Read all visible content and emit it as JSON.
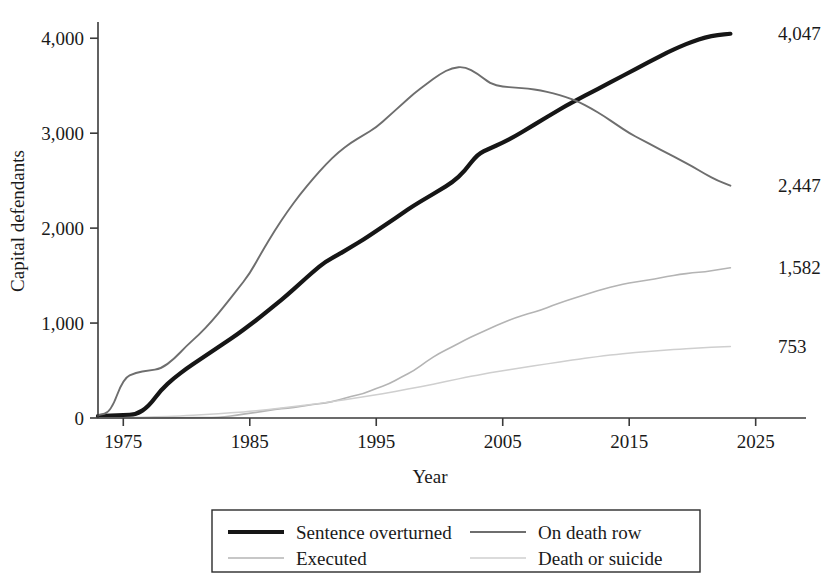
{
  "figure": {
    "width": 829,
    "height": 575,
    "background": "#ffffff"
  },
  "axes": {
    "x_title": "Year",
    "y_title": "Capital defendants",
    "x_ticks": [
      "1975",
      "1985",
      "1995",
      "2005",
      "2015",
      "2025"
    ],
    "x_tick_values": [
      1975,
      1985,
      1995,
      2005,
      2015,
      2025
    ],
    "y_ticks": [
      "0",
      "1,000",
      "2,000",
      "3,000",
      "4,000"
    ],
    "y_tick_values": [
      0,
      1000,
      2000,
      3000,
      4000
    ],
    "xlim": [
      1973,
      2025.5
    ],
    "ylim": [
      0,
      4150
    ],
    "grid": false
  },
  "legend": {
    "position": "bottom",
    "items": [
      {
        "label": "Sentence overturned",
        "color": "#161616",
        "width": 4.2,
        "key": "sentence_overturned"
      },
      {
        "label": "On death row",
        "color": "#6e6e6e",
        "width": 1.9,
        "key": "on_death_row"
      },
      {
        "label": "Executed",
        "color": "#b4b4b4",
        "width": 1.6,
        "key": "executed"
      },
      {
        "label": "Death or suicide",
        "color": "#cfcfcf",
        "width": 1.5,
        "key": "death_or_suicide"
      }
    ]
  },
  "end_labels": [
    {
      "text": "4,047",
      "series": "sentence_overturned",
      "value": 4047,
      "y": 4047
    },
    {
      "text": "2,447",
      "series": "on_death_row",
      "value": 2447,
      "y": 2447
    },
    {
      "text": "1,582",
      "series": "executed",
      "value": 1582,
      "y": 1582
    },
    {
      "text": "753",
      "series": "death_or_suicide",
      "value": 753,
      "y": 753
    }
  ],
  "chart_data": {
    "type": "line",
    "title": "",
    "subtitle": "",
    "xlabel": "Year",
    "ylabel": "Capital defendants",
    "xlim": [
      1973,
      2025.5
    ],
    "ylim": [
      0,
      4150
    ],
    "grid": false,
    "legend_position": "bottom",
    "x": [
      1973,
      1974,
      1975,
      1976,
      1977,
      1978,
      1979,
      1980,
      1981,
      1982,
      1983,
      1984,
      1985,
      1986,
      1987,
      1988,
      1989,
      1990,
      1991,
      1992,
      1993,
      1994,
      1995,
      1996,
      1997,
      1998,
      1999,
      2000,
      2001,
      2002,
      2003,
      2004,
      2005,
      2006,
      2007,
      2008,
      2009,
      2010,
      2011,
      2012,
      2013,
      2014,
      2015,
      2016,
      2017,
      2018,
      2019,
      2020,
      2021,
      2022,
      2023
    ],
    "series": [
      {
        "name": "Sentence overturned",
        "key": "sentence_overturned",
        "color": "#161616",
        "width": 4.2,
        "end_value": 4047,
        "values": [
          20,
          25,
          30,
          35,
          120,
          300,
          420,
          520,
          610,
          700,
          790,
          880,
          980,
          1080,
          1190,
          1300,
          1420,
          1540,
          1650,
          1720,
          1800,
          1880,
          1970,
          2060,
          2150,
          2240,
          2320,
          2400,
          2480,
          2600,
          2780,
          2840,
          2900,
          2970,
          3050,
          3130,
          3210,
          3290,
          3360,
          3430,
          3500,
          3570,
          3640,
          3710,
          3780,
          3850,
          3910,
          3965,
          4010,
          4035,
          4047
        ]
      },
      {
        "name": "On death row",
        "key": "on_death_row",
        "color": "#6e6e6e",
        "width": 1.9,
        "end_value": 2447,
        "values": [
          30,
          60,
          420,
          480,
          500,
          520,
          620,
          760,
          880,
          1020,
          1180,
          1350,
          1520,
          1760,
          1980,
          2180,
          2360,
          2520,
          2670,
          2800,
          2900,
          2980,
          3060,
          3180,
          3300,
          3420,
          3520,
          3620,
          3690,
          3700,
          3630,
          3520,
          3490,
          3480,
          3470,
          3450,
          3420,
          3380,
          3330,
          3260,
          3180,
          3090,
          3000,
          2930,
          2860,
          2790,
          2720,
          2650,
          2570,
          2500,
          2447
        ]
      },
      {
        "name": "Executed",
        "key": "executed",
        "color": "#b4b4b4",
        "width": 1.6,
        "end_value": 1582,
        "values": [
          0,
          0,
          0,
          0,
          1,
          1,
          2,
          3,
          4,
          6,
          11,
          32,
          50,
          68,
          93,
          104,
          120,
          143,
          157,
          188,
          226,
          257,
          313,
          358,
          432,
          500,
          598,
          683,
          749,
          820,
          885,
          944,
          1004,
          1057,
          1099,
          1136,
          1188,
          1234,
          1277,
          1320,
          1359,
          1394,
          1422,
          1442,
          1465,
          1490,
          1512,
          1529,
          1540,
          1563,
          1582
        ]
      },
      {
        "name": "Death or suicide",
        "key": "death_or_suicide",
        "color": "#cfcfcf",
        "width": 1.5,
        "end_value": 753,
        "values": [
          0,
          1,
          3,
          6,
          10,
          14,
          19,
          25,
          32,
          40,
          49,
          59,
          70,
          83,
          97,
          112,
          128,
          145,
          163,
          182,
          202,
          223,
          245,
          268,
          292,
          317,
          343,
          370,
          398,
          426,
          452,
          476,
          498,
          519,
          540,
          560,
          580,
          600,
          620,
          638,
          655,
          670,
          683,
          695,
          706,
          716,
          726,
          734,
          741,
          747,
          753
        ]
      }
    ]
  }
}
